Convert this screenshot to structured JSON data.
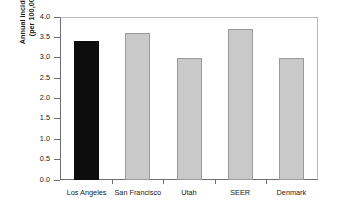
{
  "chart_data": {
    "type": "bar",
    "title": "",
    "xlabel": "",
    "ylabel": "Annual incidence (per 100,000)",
    "ylabel_line1": "Annual incidence",
    "ylabel_line2": "(per 100,000)",
    "categories": [
      "Los Angeles",
      "San Francisco",
      "Utah",
      "SEER",
      "Denmark"
    ],
    "values": [
      3.4,
      3.6,
      3.0,
      3.7,
      3.0
    ],
    "bar_colors": [
      "#0d0d0d",
      "#c9c9c9",
      "#c9c9c9",
      "#c9c9c9",
      "#c9c9c9"
    ],
    "highlighted_category": "Los Angeles",
    "ylim": [
      0.0,
      4.0
    ],
    "ytick_values": [
      4.0,
      3.5,
      3.0,
      2.5,
      2.0,
      1.5,
      1.0,
      0.5,
      0.0
    ],
    "ytick_labels": [
      "4.0",
      "3.5",
      "3.0",
      "2.5",
      "2.0",
      "1.5",
      "1.0",
      "0.5",
      "0.0"
    ],
    "grid": false,
    "legend": null,
    "legend_position": "none"
  },
  "colors": {
    "bar_gray": "#c9c9c9",
    "bar_gray_edge": "#9a9a9a",
    "bar_black": "#0d0d0d",
    "axis": "#6e6e6e",
    "frame_light": "#b9b9b9",
    "text": "#1a1a1a",
    "background": "#ffffff"
  }
}
